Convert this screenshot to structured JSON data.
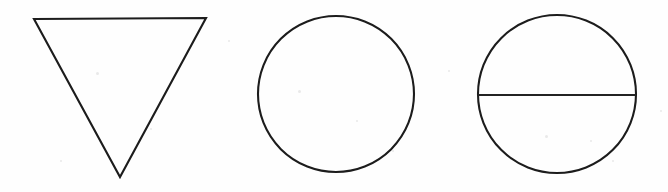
{
  "canvas": {
    "width": 668,
    "height": 192,
    "background_color": "#fefefe",
    "stroke_color": "#1c1c1c",
    "description": "Line drawing of three geometric shapes"
  },
  "shapes": [
    {
      "id": "inverted-triangle",
      "label": "Inverted triangle",
      "type": "triangle",
      "orientation": "point-down",
      "points": "34,19 206,18 120,177",
      "vertices": [
        {
          "x": 34,
          "y": 19
        },
        {
          "x": 206,
          "y": 18
        },
        {
          "x": 120,
          "y": 177
        }
      ],
      "filled": false,
      "stroke_width": 2.1
    },
    {
      "id": "plain-circle",
      "label": "Circle",
      "type": "circle",
      "center": {
        "x": 336,
        "y": 94
      },
      "radius_x": 78,
      "radius_y": 78,
      "filled": false,
      "stroke_width": 2.1
    },
    {
      "id": "bisected-circle",
      "label": "Circle with horizontal diameter",
      "type": "circle-with-diameter",
      "center": {
        "x": 557,
        "y": 94
      },
      "radius_x": 79,
      "radius_y": 79,
      "filled": false,
      "stroke_width": 2.1,
      "diameter_line": {
        "x1": 478,
        "y1": 95,
        "x2": 636,
        "y2": 95,
        "orientation": "horizontal",
        "stroke_width": 2
      }
    }
  ],
  "specks": [
    {
      "x": 96,
      "y": 72,
      "size": 3
    },
    {
      "x": 150,
      "y": 128,
      "size": 2
    },
    {
      "x": 60,
      "y": 160,
      "size": 2
    },
    {
      "x": 298,
      "y": 90,
      "size": 3
    },
    {
      "x": 356,
      "y": 120,
      "size": 2
    },
    {
      "x": 392,
      "y": 150,
      "size": 2
    },
    {
      "x": 545,
      "y": 135,
      "size": 3
    },
    {
      "x": 590,
      "y": 140,
      "size": 2
    },
    {
      "x": 612,
      "y": 160,
      "size": 2
    },
    {
      "x": 228,
      "y": 40,
      "size": 2
    },
    {
      "x": 448,
      "y": 70,
      "size": 2
    },
    {
      "x": 660,
      "y": 110,
      "size": 2
    }
  ]
}
